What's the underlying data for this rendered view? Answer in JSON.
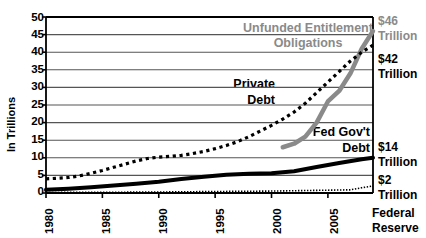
{
  "chart_data": {
    "type": "line",
    "title": "",
    "xlabel": "",
    "ylabel": "In Trillions",
    "xlim": [
      1980,
      2009
    ],
    "ylim": [
      0,
      50
    ],
    "grid": true,
    "legend": "inline-annotations",
    "ytick_labels": [
      "0",
      "5",
      "10",
      "15",
      "20",
      "25",
      "30",
      "35",
      "40",
      "45",
      "50"
    ],
    "ytick_values": [
      0,
      5,
      10,
      15,
      20,
      25,
      30,
      35,
      40,
      45,
      50
    ],
    "xtick_labels": [
      "1980",
      "1985",
      "1990",
      "1995",
      "2000",
      "2005"
    ],
    "xtick_values": [
      1980,
      1985,
      1990,
      1995,
      2000,
      2005
    ],
    "series": [
      {
        "name": "Unfunded Entitlement Obligations",
        "style": "thick-gray-line",
        "color": "#8a8a8a",
        "x": [
          2001,
          2002,
          2003,
          2004,
          2005,
          2006,
          2007,
          2008,
          2009
        ],
        "values": [
          13,
          14,
          16,
          20,
          26,
          29,
          34,
          41,
          46
        ]
      },
      {
        "name": "Private Debt",
        "style": "black-dotted",
        "color": "#000000",
        "x": [
          1980,
          1981,
          1982,
          1983,
          1984,
          1985,
          1986,
          1987,
          1988,
          1989,
          1990,
          1991,
          1992,
          1993,
          1994,
          1995,
          1996,
          1997,
          1998,
          1999,
          2000,
          2001,
          2002,
          2003,
          2004,
          2005,
          2006,
          2007,
          2008,
          2009
        ],
        "values": [
          4,
          4.2,
          4.4,
          4.9,
          5.6,
          6.4,
          7.3,
          8.2,
          9.1,
          9.8,
          10.2,
          10.4,
          10.7,
          11.2,
          11.8,
          12.6,
          13.5,
          14.6,
          16.0,
          17.6,
          19.2,
          21.0,
          23.0,
          25.5,
          28.5,
          31.5,
          34.5,
          37.5,
          40.0,
          42.0
        ]
      },
      {
        "name": "Fed Gov't Debt",
        "style": "thick-black-line",
        "color": "#000000",
        "x": [
          1980,
          1982,
          1984,
          1986,
          1988,
          1990,
          1992,
          1994,
          1996,
          1998,
          2000,
          2002,
          2004,
          2006,
          2008,
          2009
        ],
        "values": [
          0.9,
          1.2,
          1.6,
          2.1,
          2.6,
          3.2,
          4.0,
          4.6,
          5.2,
          5.5,
          5.6,
          6.2,
          7.4,
          8.5,
          9.6,
          10.0
        ]
      },
      {
        "name": "Federal Reserve",
        "style": "fine-dotted",
        "color": "#000000",
        "x": [
          1980,
          1985,
          1990,
          1995,
          2000,
          2003,
          2005,
          2007,
          2008,
          2009
        ],
        "values": [
          0.15,
          0.2,
          0.28,
          0.42,
          0.55,
          0.7,
          0.8,
          0.9,
          1.5,
          2.0
        ]
      }
    ],
    "annotations": [
      {
        "id": "unfunded",
        "text_line1": "Unfunded Entitlement",
        "text_line2": "Obligations",
        "color": "#8a8a8a"
      },
      {
        "id": "private",
        "text_line1": "Private",
        "text_line2": "Debt",
        "color": "#000000"
      },
      {
        "id": "fedgov",
        "text_line1": "Fed Gov't",
        "text_line2": "Debt",
        "color": "#000000"
      }
    ],
    "endpoint_labels": [
      {
        "id": "unfunded-value",
        "amount": "$46",
        "unit": "Trillion",
        "color": "#8a8a8a"
      },
      {
        "id": "private-value",
        "amount": "$42",
        "unit": "Trillion",
        "color": "#000000"
      },
      {
        "id": "fedgov-value",
        "amount": "$14",
        "unit": "Trillion",
        "color": "#000000"
      },
      {
        "id": "fedreserve-value",
        "amount": "$2",
        "unit": "Trillion",
        "color": "#000000"
      }
    ],
    "outside_label": {
      "line1": "Federal",
      "line2": "Reserve"
    }
  }
}
